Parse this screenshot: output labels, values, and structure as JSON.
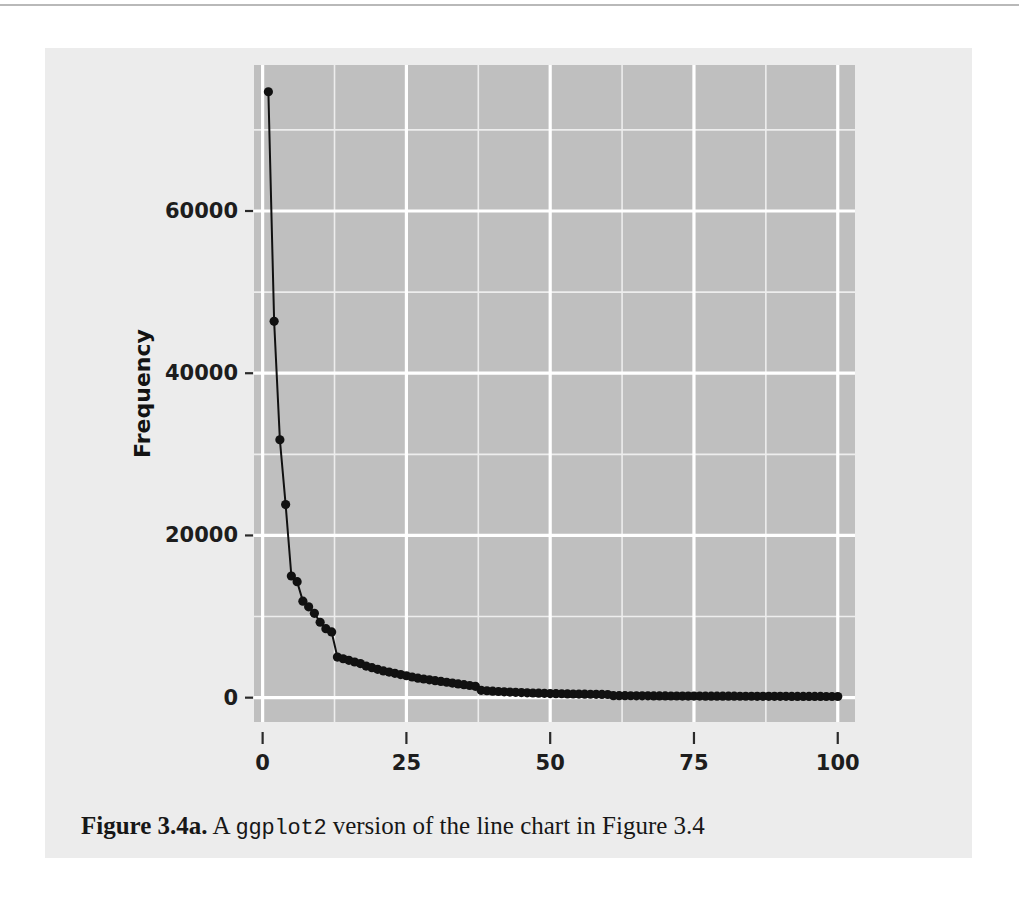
{
  "figure": {
    "caption_label": "Figure 3.4a.",
    "caption_text_before": "A",
    "caption_code": "ggplot2",
    "caption_text_after": "version of the line chart in Figure 3.4"
  },
  "colors": {
    "page_background": "#ffffff",
    "figure_background": "#ececec",
    "panel_background": "#bfbfbf",
    "gridline_major": "#ffffff",
    "gridline_minor": "#ededed",
    "series_color": "#111111",
    "axis_text": "#1d1d1d",
    "top_rule": "#b9b9b9"
  },
  "chart_data": {
    "type": "line",
    "title": "",
    "subtitle": "",
    "xlabel": "Index",
    "ylabel": "Frequency",
    "xlim": [
      -1.5,
      103
    ],
    "ylim": [
      -3000,
      78000
    ],
    "xticks": [
      0,
      25,
      50,
      75,
      100
    ],
    "xtick_labels": [
      "0",
      "25",
      "50",
      "75",
      "100"
    ],
    "yticks": [
      0,
      20000,
      40000,
      60000
    ],
    "ytick_labels": [
      "0",
      "20000",
      "40000",
      "60000"
    ],
    "x_minor_ticks": [
      12.5,
      37.5,
      62.5,
      87.5
    ],
    "y_minor_ticks": [
      10000,
      30000,
      50000,
      70000
    ],
    "grid": true,
    "legend": "none",
    "markers": true,
    "marker_shape": "circle",
    "marker_size": 4.6,
    "line_width": 2.0,
    "series": [
      {
        "name": "Frequency",
        "x": [
          1,
          2,
          3,
          4,
          5,
          6,
          7,
          8,
          9,
          10,
          11,
          12,
          13,
          14,
          15,
          16,
          17,
          18,
          19,
          20,
          21,
          22,
          23,
          24,
          25,
          26,
          27,
          28,
          29,
          30,
          31,
          32,
          33,
          34,
          35,
          36,
          37,
          38,
          39,
          40,
          41,
          42,
          43,
          44,
          45,
          46,
          47,
          48,
          49,
          50,
          51,
          52,
          53,
          54,
          55,
          56,
          57,
          58,
          59,
          60,
          61,
          62,
          63,
          64,
          65,
          66,
          67,
          68,
          69,
          70,
          71,
          72,
          73,
          74,
          75,
          76,
          77,
          78,
          79,
          80,
          81,
          82,
          83,
          84,
          85,
          86,
          87,
          88,
          89,
          90,
          91,
          92,
          93,
          94,
          95,
          96,
          97,
          98,
          99,
          100
        ],
        "values": [
          74700,
          46400,
          31800,
          23800,
          15000,
          14300,
          11900,
          11200,
          10400,
          9300,
          8500,
          8100,
          5000,
          4800,
          4600,
          4400,
          4200,
          3900,
          3700,
          3500,
          3300,
          3150,
          3000,
          2850,
          2700,
          2550,
          2400,
          2300,
          2200,
          2100,
          2000,
          1900,
          1800,
          1700,
          1600,
          1500,
          1400,
          900,
          850,
          800,
          760,
          720,
          690,
          660,
          630,
          600,
          575,
          550,
          530,
          510,
          495,
          480,
          465,
          450,
          440,
          430,
          420,
          410,
          400,
          390,
          250,
          245,
          240,
          235,
          230,
          225,
          222,
          218,
          215,
          212,
          208,
          205,
          202,
          199,
          196,
          193,
          190,
          187,
          185,
          182,
          180,
          178,
          176,
          174,
          172,
          170,
          168,
          166,
          164,
          162,
          160,
          158,
          156,
          154,
          152,
          150,
          148,
          146,
          144,
          142
        ]
      }
    ]
  }
}
